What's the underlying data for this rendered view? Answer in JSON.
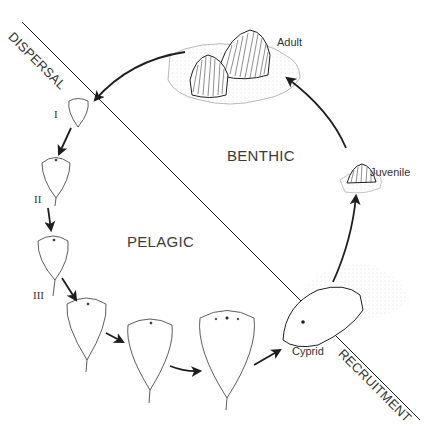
{
  "zones": {
    "benthic": "BENTHIC",
    "pelagic": "PELAGIC"
  },
  "boundaries": {
    "dispersal": "DISPERSAL",
    "recruitment": "RECRUITMENT"
  },
  "stages": {
    "adult": "Adult",
    "juvenile": "Juvenile",
    "cypris": "Cyprid"
  },
  "naupliar_stages": {
    "i": "I",
    "ii": "II",
    "iii": "III"
  },
  "colors": {
    "line": "#1e1e1e",
    "background": "#ffffff",
    "stipple": "#cfcfcf"
  }
}
